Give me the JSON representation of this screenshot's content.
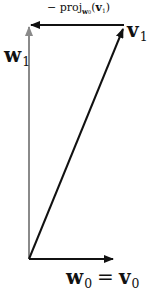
{
  "diagram": {
    "type": "vector-projection (Gram-Schmidt)",
    "colors": {
      "black_arrows": "#111111",
      "gray_arrow": "#8a8a8a",
      "background": "#ffffff"
    },
    "labels": {
      "proj_prefix": "− proj",
      "proj_subscript": "w",
      "proj_subscript_index": "0",
      "proj_open": "(",
      "proj_vector": "v",
      "proj_vector_index": "1",
      "proj_close": ")",
      "v1_letter": "v",
      "v1_index": "1",
      "w1_letter": "w",
      "w1_index": "1",
      "w0_letter": "w",
      "w0_index": "0",
      "equals": "=",
      "v0_letter": "v",
      "v0_index": "0"
    },
    "vectors": [
      {
        "name": "w0 = v0",
        "from": [
          29,
          259
        ],
        "to": [
          113,
          259
        ],
        "color": "black"
      },
      {
        "name": "v1",
        "from": [
          29,
          259
        ],
        "to": [
          124,
          28
        ],
        "color": "black"
      },
      {
        "name": "-proj_w0(v1)",
        "from": [
          124,
          25
        ],
        "to": [
          30,
          25
        ],
        "color": "black"
      },
      {
        "name": "w1",
        "from": [
          29,
          259
        ],
        "to": [
          29,
          26
        ],
        "color": "gray"
      }
    ]
  }
}
